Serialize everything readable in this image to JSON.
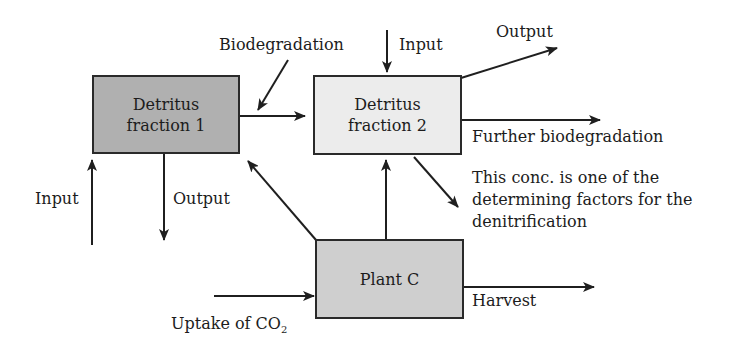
{
  "nodes": {
    "detritus1": {
      "line1": "Detritus",
      "line2": "fraction 1",
      "fill": "#b0b0b0"
    },
    "detritus2": {
      "line1": "Detritus",
      "line2": "fraction 2",
      "fill": "#ececec"
    },
    "plant": {
      "label": "Plant C",
      "fill": "#cfcfcf"
    }
  },
  "labels": {
    "biodegradation": "Biodegradation",
    "input_top": "Input",
    "output_top": "Output",
    "further_biodegradation": "Further biodegradation",
    "note_line1": "This conc. is one of the",
    "note_line2": "determining factors for the",
    "note_line3": "denitrification",
    "input_left": "Input",
    "output_left": "Output",
    "harvest": "Harvest",
    "uptake_prefix": "Uptake of CO",
    "uptake_sub": "2"
  },
  "colors": {
    "line": "#1f1f1f"
  }
}
